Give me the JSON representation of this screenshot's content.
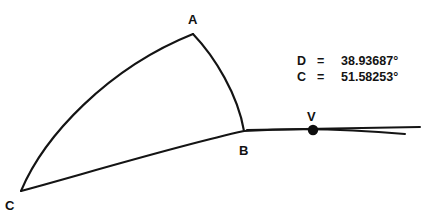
{
  "figure": {
    "background_color": "#ffffff",
    "stroke_color": "#141414",
    "points": [
      {
        "id": "A",
        "label": "A",
        "x": 193,
        "y": 34,
        "label_x": 188,
        "label_y": 24
      },
      {
        "id": "B",
        "label": "B",
        "x": 244,
        "y": 131,
        "label_x": 239,
        "label_y": 155
      },
      {
        "id": "C",
        "label": "C",
        "x": 21,
        "y": 191,
        "label_x": 5,
        "label_y": 210
      },
      {
        "id": "V",
        "label": "V",
        "x": 313,
        "y": 130,
        "label_x": 307,
        "label_y": 121
      }
    ],
    "vertex_dot": {
      "cx": 313,
      "cy": 130,
      "r": 5.2
    },
    "paths": {
      "arc_c_to_a": "M 21 191 C 44 136, 108 68, 193 34",
      "arc_a_to_b": "M 193 34 C 215 57, 238 95, 244 131",
      "curve_c_to_b": "M 21 191 C 80 175, 180 145, 244 131",
      "curve_b_to_right_lower": "M 244 131 C 290 128, 350 129, 405 134",
      "line_b_to_right_upper": "M 247 130 L 420 127"
    }
  },
  "readout": {
    "rows": [
      {
        "name": "D",
        "equals": "=",
        "value": "38.93687°"
      },
      {
        "name": "C",
        "equals": "=",
        "value": "51.58253°"
      }
    ]
  }
}
